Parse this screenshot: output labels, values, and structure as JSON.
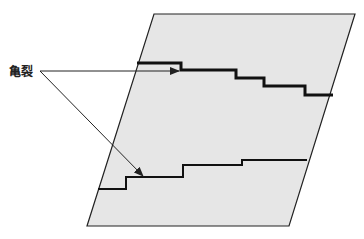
{
  "diagram": {
    "label": "亀裂",
    "colors": {
      "panel_fill": "#e6e6e6",
      "outline": "#222222",
      "crack": "#111111",
      "background": "#ffffff"
    },
    "panel": {
      "shape": "parallelogram",
      "points": [
        [
          154,
          14
        ],
        [
          355,
          14
        ],
        [
          289,
          226
        ],
        [
          87,
          226
        ]
      ]
    },
    "cracks": [
      {
        "name": "upper-crack",
        "points": [
          [
            137,
            63
          ],
          [
            181,
            63
          ],
          [
            181,
            70
          ],
          [
            236,
            70
          ],
          [
            236,
            78
          ],
          [
            264,
            78
          ],
          [
            264,
            86
          ],
          [
            305,
            86
          ],
          [
            305,
            95
          ],
          [
            333,
            95
          ]
        ]
      },
      {
        "name": "lower-crack",
        "points": [
          [
            98,
            189
          ],
          [
            126,
            189
          ],
          [
            126,
            177
          ],
          [
            183,
            177
          ],
          [
            183,
            165
          ],
          [
            242,
            165
          ],
          [
            242,
            160
          ],
          [
            307,
            160
          ]
        ]
      }
    ],
    "arrows": [
      {
        "from": [
          40,
          71
        ],
        "to": [
          179,
          71
        ]
      },
      {
        "from": [
          40,
          71
        ],
        "to": [
          143,
          177
        ]
      }
    ]
  }
}
